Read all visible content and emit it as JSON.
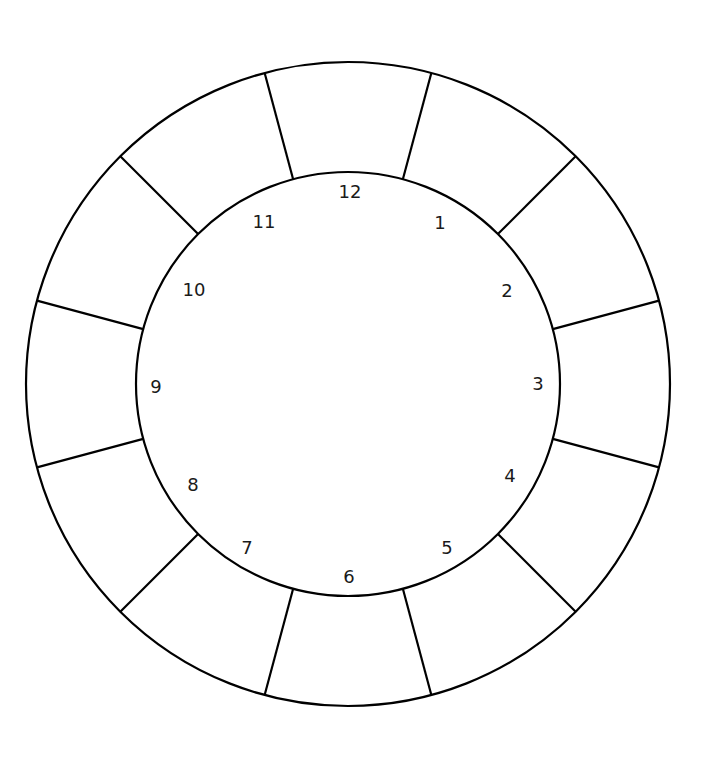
{
  "diagram": {
    "name": "clock-wheel-diagram",
    "background_color": "#ffffff",
    "stroke_color": "#000000",
    "label_color": "#1a1a1a",
    "stroke_width": 2.2,
    "geometry": {
      "center_x": 348,
      "center_y": 384,
      "outer_radius": 322,
      "ring_inner_radius": 212,
      "inner_circle_radius": 212,
      "label_radius": 186,
      "segment_count": 12,
      "segment_angle_deg": 30,
      "spoke_offset_deg": 15
    },
    "hours": [
      {
        "label": "12",
        "hour": 12,
        "angle_deg": 0,
        "x": 350,
        "y": 193
      },
      {
        "label": "1",
        "hour": 1,
        "angle_deg": 30,
        "x": 440,
        "y": 224
      },
      {
        "label": "2",
        "hour": 2,
        "angle_deg": 60,
        "x": 507,
        "y": 292
      },
      {
        "label": "3",
        "hour": 3,
        "angle_deg": 90,
        "x": 538,
        "y": 385
      },
      {
        "label": "4",
        "hour": 4,
        "angle_deg": 120,
        "x": 510,
        "y": 477
      },
      {
        "label": "5",
        "hour": 5,
        "angle_deg": 150,
        "x": 447,
        "y": 549
      },
      {
        "label": "6",
        "hour": 6,
        "angle_deg": 180,
        "x": 349,
        "y": 578
      },
      {
        "label": "7",
        "hour": 7,
        "angle_deg": 210,
        "x": 247,
        "y": 549
      },
      {
        "label": "8",
        "hour": 8,
        "angle_deg": 240,
        "x": 193,
        "y": 486
      },
      {
        "label": "9",
        "hour": 9,
        "angle_deg": 270,
        "x": 156,
        "y": 388
      },
      {
        "label": "10",
        "hour": 10,
        "angle_deg": 300,
        "x": 194,
        "y": 291
      },
      {
        "label": "11",
        "hour": 11,
        "angle_deg": 330,
        "x": 264,
        "y": 223
      }
    ],
    "spokes": [
      {
        "name": "spoke-12-1",
        "angle_deg": 15
      },
      {
        "name": "spoke-1-2",
        "angle_deg": 45
      },
      {
        "name": "spoke-2-3",
        "angle_deg": 75
      },
      {
        "name": "spoke-3-4",
        "angle_deg": 105
      },
      {
        "name": "spoke-4-5",
        "angle_deg": 135
      },
      {
        "name": "spoke-5-6",
        "angle_deg": 165
      },
      {
        "name": "spoke-6-7",
        "angle_deg": 195
      },
      {
        "name": "spoke-7-8",
        "angle_deg": 225
      },
      {
        "name": "spoke-8-9",
        "angle_deg": 255
      },
      {
        "name": "spoke-9-10",
        "angle_deg": 285
      },
      {
        "name": "spoke-10-11",
        "angle_deg": 315
      },
      {
        "name": "spoke-11-12",
        "angle_deg": 345
      }
    ],
    "segments": [
      {
        "name": "segment-12-1",
        "between": "12-1"
      },
      {
        "name": "segment-1-2",
        "between": "1-2"
      },
      {
        "name": "segment-2-3",
        "between": "2-3"
      },
      {
        "name": "segment-3-4",
        "between": "3-4"
      },
      {
        "name": "segment-4-5",
        "between": "4-5"
      },
      {
        "name": "segment-5-6",
        "between": "5-6"
      },
      {
        "name": "segment-6-7",
        "between": "6-7"
      },
      {
        "name": "segment-7-8",
        "between": "7-8"
      },
      {
        "name": "segment-8-9",
        "between": "8-9"
      },
      {
        "name": "segment-9-10",
        "between": "9-10"
      },
      {
        "name": "segment-10-11",
        "between": "10-11"
      },
      {
        "name": "segment-11-12",
        "between": "11-12"
      }
    ]
  }
}
